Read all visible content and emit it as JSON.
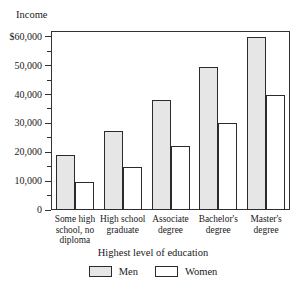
{
  "chart_data": {
    "type": "bar",
    "title": "",
    "ylabel": "Income",
    "xlabel": "Highest level of education",
    "categories": [
      "Some high school, no diploma",
      "High school graduate",
      "Associate degree",
      "Bachelor's degree",
      "Master's degree"
    ],
    "series": [
      {
        "name": "Men",
        "values": [
          19000,
          27300,
          38000,
          49500,
          60000
        ]
      },
      {
        "name": "Women",
        "values": [
          9700,
          15000,
          22000,
          30000,
          40000
        ]
      }
    ],
    "ylim": [
      0,
      62000
    ],
    "ytick_values": [
      0,
      10000,
      20000,
      30000,
      40000,
      50000,
      60000
    ],
    "ytick_labels": [
      "0",
      "10,000",
      "20,000",
      "30,000",
      "40,000",
      "50,000",
      "$60,000"
    ],
    "yminor_values": [
      5000,
      15000,
      25000,
      35000,
      45000,
      55000
    ],
    "grid": false,
    "legend_position": "bottom",
    "legend_entries": [
      "Men",
      "Women"
    ],
    "colors": {
      "men_fill": "#e6e6e6",
      "women_fill": "#ffffff",
      "bar_stroke": "#2b2b2b",
      "frame": "#333333",
      "text": "#1a1a1a"
    }
  },
  "category_lines": [
    [
      "Some high",
      "school, no",
      "diploma"
    ],
    [
      "High school",
      "graduate"
    ],
    [
      "Associate",
      "degree"
    ],
    [
      "Bachelor's",
      "degree"
    ],
    [
      "Master's",
      "degree"
    ]
  ]
}
